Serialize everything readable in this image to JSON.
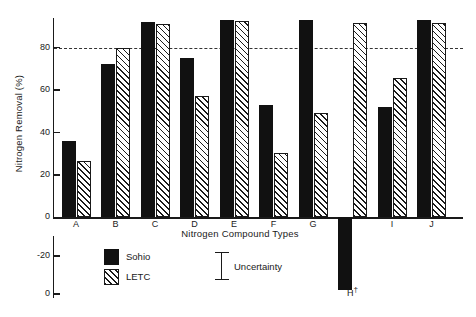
{
  "chart_data": {
    "type": "bar",
    "title": "",
    "xlabel": "Nitrogen Compound Types",
    "ylabel": "Nitrogen Removal (%)",
    "categories": [
      "A",
      "B",
      "C",
      "D",
      "E",
      "F",
      "G",
      "H",
      "I",
      "J"
    ],
    "category_footnotes": {
      "H": "†"
    },
    "series": [
      {
        "name": "Sohio",
        "fill": "solid-black",
        "color": "#111111",
        "values": [
          36,
          72.5,
          92,
          75,
          93,
          53,
          93,
          -38,
          52,
          93
        ]
      },
      {
        "name": "LETC",
        "fill": "diagonal-hatch",
        "color": "#1a1a1a",
        "values": [
          26.5,
          80,
          91,
          57,
          92.5,
          30.5,
          49,
          91.5,
          65.5,
          91.5
        ]
      }
    ],
    "ytick_labels": [
      "80",
      "60",
      "40",
      "20",
      "0",
      "-20",
      "0"
    ],
    "ytick_values": [
      80,
      60,
      40,
      20,
      0,
      -20,
      -40
    ],
    "ylim": [
      -40,
      95
    ],
    "axis_break": true,
    "grid": false,
    "reference_line": {
      "value": 80,
      "style": "dashed",
      "color": "#333333"
    },
    "legend": {
      "position": "below-plot-left",
      "entries": [
        {
          "label": "Sohio",
          "swatch": "solid-black"
        },
        {
          "label": "LETC",
          "swatch": "diagonal-hatch"
        }
      ]
    },
    "annotations": [
      {
        "name": "uncertainty-marker",
        "label": "Uncertainty",
        "glyph": "error-bar"
      }
    ]
  },
  "geometry": {
    "baseline_y": 217.4,
    "px_per_unit": 2.1225,
    "plot_left": 54,
    "group_step": 39.5,
    "group_first_center": 76,
    "bar_width": 14,
    "bar_gap": 1,
    "lower_axis": {
      "minus20_y": 256,
      "minus40_y": 294
    }
  }
}
